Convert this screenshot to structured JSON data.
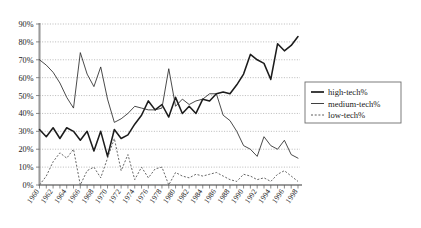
{
  "chart_data": {
    "type": "line",
    "title": "",
    "xlabel": "",
    "ylabel": "",
    "ylim": [
      0,
      90
    ],
    "ytick_labels": [
      "0%",
      "10%",
      "20%",
      "30%",
      "40%",
      "50%",
      "60%",
      "70%",
      "80%",
      "90%"
    ],
    "ytick_values": [
      0,
      10,
      20,
      30,
      40,
      50,
      60,
      70,
      80,
      90
    ],
    "grid": true,
    "legend_position": "right",
    "x": [
      1960,
      1961,
      1962,
      1963,
      1964,
      1965,
      1966,
      1967,
      1968,
      1969,
      1970,
      1971,
      1972,
      1973,
      1974,
      1975,
      1976,
      1977,
      1978,
      1979,
      1980,
      1981,
      1982,
      1983,
      1984,
      1985,
      1986,
      1987,
      1988,
      1989,
      1990,
      1991,
      1992,
      1993,
      1994,
      1995,
      1996,
      1997,
      1998
    ],
    "xtick_labels": [
      "1960",
      "1962",
      "1964",
      "1966",
      "1968",
      "1970",
      "1972",
      "1974",
      "1976",
      "1978",
      "1980",
      "1982",
      "1984",
      "1986",
      "1988",
      "1990",
      "1992",
      "1994",
      "1996",
      "1998"
    ],
    "xtick_values": [
      1960,
      1962,
      1964,
      1966,
      1968,
      1970,
      1972,
      1974,
      1976,
      1978,
      1980,
      1982,
      1984,
      1986,
      1988,
      1990,
      1992,
      1994,
      1996,
      1998
    ],
    "series": [
      {
        "name": "high-tech%",
        "style": "solid-thick",
        "values": [
          31,
          27,
          32,
          26,
          32,
          30,
          25,
          30,
          19,
          30,
          16,
          31,
          26,
          28,
          34,
          39,
          47,
          42,
          45,
          38,
          49,
          40,
          44,
          40,
          48,
          47,
          51,
          52,
          51,
          56,
          62,
          73,
          70,
          68,
          59,
          79,
          75,
          78,
          83
        ]
      },
      {
        "name": "medium-tech%",
        "style": "solid-thin",
        "values": [
          70,
          67,
          63,
          57,
          49,
          43,
          74,
          62,
          55,
          66,
          48,
          35,
          37,
          40,
          44,
          43,
          42,
          42,
          43,
          65,
          44,
          48,
          45,
          47,
          48,
          51,
          51,
          39,
          36,
          30,
          22,
          20,
          16,
          27,
          22,
          20,
          25,
          17,
          15
        ]
      },
      {
        "name": "low-tech%",
        "style": "dotted",
        "values": [
          0,
          5,
          13,
          18,
          15,
          20,
          0,
          8,
          10,
          4,
          15,
          26,
          8,
          17,
          3,
          10,
          4,
          9,
          10,
          0,
          7,
          5,
          4,
          6,
          5,
          6,
          7,
          5,
          3,
          2,
          6,
          5,
          3,
          4,
          2,
          6,
          8,
          5,
          2
        ]
      }
    ]
  },
  "legend": {
    "items": [
      {
        "label": "high-tech%"
      },
      {
        "label": "medium-tech%"
      },
      {
        "label": "low-tech%"
      }
    ]
  }
}
